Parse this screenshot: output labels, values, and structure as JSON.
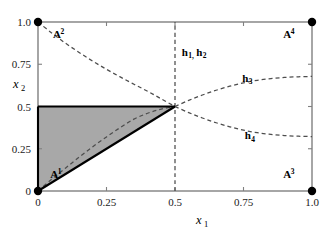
{
  "chart_data": {
    "type": "line",
    "title": "",
    "xlabel": "x1",
    "ylabel": "x2",
    "xlim": [
      0,
      1
    ],
    "ylim": [
      0,
      1
    ],
    "grid": false,
    "legend_position": "inline-annotations",
    "xticks": [
      0,
      0.25,
      0.5,
      0.75,
      1.0
    ],
    "xticklabels": [
      "0",
      "0.25",
      "0.5",
      "0.75",
      "1.0"
    ],
    "yticks": [
      0,
      0.25,
      0.5,
      0.75,
      1.0
    ],
    "yticklabels": [
      "0",
      "0.25",
      "0.5",
      "0.75",
      "1.0"
    ],
    "series": [
      {
        "name": "h2",
        "label": "A2-curve",
        "style": "dashed",
        "points": [
          [
            0,
            1.0
          ],
          [
            0.05,
            0.935
          ],
          [
            0.1,
            0.875
          ],
          [
            0.15,
            0.82
          ],
          [
            0.2,
            0.768
          ],
          [
            0.25,
            0.72
          ],
          [
            0.3,
            0.675
          ],
          [
            0.35,
            0.632
          ],
          [
            0.4,
            0.59
          ],
          [
            0.45,
            0.545
          ],
          [
            0.5,
            0.5
          ]
        ]
      },
      {
        "name": "h1",
        "label": "A1-curve",
        "style": "dashed",
        "points": [
          [
            0,
            0.0
          ],
          [
            0.05,
            0.07
          ],
          [
            0.1,
            0.135
          ],
          [
            0.15,
            0.2
          ],
          [
            0.2,
            0.262
          ],
          [
            0.25,
            0.32
          ],
          [
            0.3,
            0.375
          ],
          [
            0.35,
            0.425
          ],
          [
            0.4,
            0.46
          ],
          [
            0.45,
            0.485
          ],
          [
            0.5,
            0.5
          ]
        ]
      },
      {
        "name": "h3",
        "label": "h3",
        "style": "dashed",
        "points": [
          [
            0.5,
            0.5
          ],
          [
            0.55,
            0.536
          ],
          [
            0.6,
            0.568
          ],
          [
            0.65,
            0.596
          ],
          [
            0.7,
            0.62
          ],
          [
            0.75,
            0.64
          ],
          [
            0.8,
            0.655
          ],
          [
            0.85,
            0.665
          ],
          [
            0.9,
            0.672
          ],
          [
            0.95,
            0.676
          ],
          [
            1.0,
            0.678
          ]
        ]
      },
      {
        "name": "h4",
        "label": "h4",
        "style": "dashed",
        "points": [
          [
            0.5,
            0.5
          ],
          [
            0.55,
            0.464
          ],
          [
            0.6,
            0.432
          ],
          [
            0.65,
            0.404
          ],
          [
            0.7,
            0.38
          ],
          [
            0.75,
            0.36
          ],
          [
            0.8,
            0.345
          ],
          [
            0.85,
            0.335
          ],
          [
            0.9,
            0.328
          ],
          [
            0.95,
            0.324
          ],
          [
            1.0,
            0.322
          ]
        ]
      },
      {
        "name": "h1h2-vertical",
        "label": "h1, h2",
        "style": "dashed",
        "points": [
          [
            0.5,
            0.0
          ],
          [
            0.5,
            1.0
          ]
        ]
      }
    ],
    "shaded_region": {
      "name": "equilibrium-set",
      "fill": "#a8a8a8",
      "vertices": [
        [
          0,
          0
        ],
        [
          0,
          0.5
        ],
        [
          0.5,
          0.5
        ]
      ]
    },
    "vertex_markers": [
      {
        "name": "A1",
        "x": 0,
        "y": 0
      },
      {
        "name": "A2",
        "x": 0,
        "y": 1
      },
      {
        "name": "A3",
        "x": 1,
        "y": 0
      },
      {
        "name": "A4",
        "x": 1,
        "y": 1
      }
    ]
  },
  "labels": {
    "vertices": [
      {
        "base": "A",
        "sup": "1",
        "x": 0.045,
        "y": 0.075
      },
      {
        "base": "A",
        "sup": "2",
        "x": 0.055,
        "y": 0.905
      },
      {
        "base": "A",
        "sup": "3",
        "x": 0.895,
        "y": 0.075
      },
      {
        "base": "A",
        "sup": "4",
        "x": 0.895,
        "y": 0.905
      }
    ],
    "curves": [
      {
        "base": "h",
        "sub": "1, h",
        "sub2": "2",
        "text": "h1, h2",
        "x": 0.525,
        "y": 0.8
      },
      {
        "base": "h",
        "sub": "3",
        "text": "h3",
        "x": 0.745,
        "y": 0.645
      },
      {
        "base": "h",
        "sub": "4",
        "text": "h4",
        "x": 0.755,
        "y": 0.305
      }
    ]
  },
  "axes": {
    "x_title": "x",
    "x_subscript": "1",
    "y_title": "x",
    "y_subscript": "2"
  },
  "colors": {
    "frame": "#808080",
    "shade": "#a8a8a8",
    "triangle_edge": "#000000",
    "dashed": "#4d4d4d",
    "text": "#000000",
    "background": "#ffffff"
  }
}
